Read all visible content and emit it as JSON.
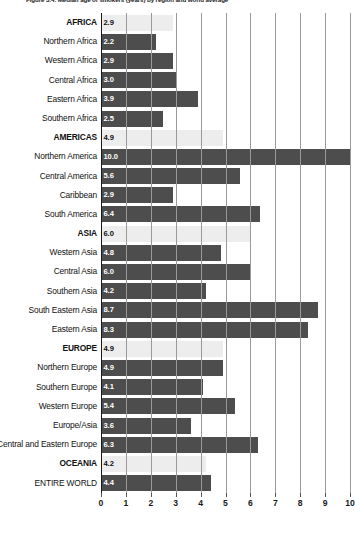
{
  "figure": {
    "title": "Figure 3.4: Median age of smokers (years) by region and world average"
  },
  "chart_data": {
    "type": "bar",
    "orientation": "horizontal",
    "title": "Figure 3.4: Median age of smokers (years) by region and world average",
    "xlabel": "",
    "ylabel": "",
    "xlim": [
      0,
      10
    ],
    "xticks": [
      "0",
      "1",
      "2",
      "3",
      "4",
      "5",
      "6",
      "7",
      "8",
      "9",
      "10"
    ],
    "grid": true,
    "legend": "none",
    "colors": {
      "region_header_bar": "#ededed",
      "subregion_bar": "#4d4d4d",
      "axis": "#1a1a1a",
      "gridline": "#9a9a9a",
      "header_value_text": "#111111",
      "bar_value_text": "#ffffff"
    },
    "categories": [
      "AFRICA",
      "Northern Africa",
      "Western Africa",
      "Central Africa",
      "Eastern Africa",
      "Southern Africa",
      "AMERICAS",
      "Northern America",
      "Central America",
      "Caribbean",
      "South America",
      "ASIA",
      "Western Asia",
      "Central Asia",
      "Southern Asia",
      "South Eastern Asia",
      "Eastern Asia",
      "EUROPE",
      "Northern Europe",
      "Southern Europe",
      "Western Europe",
      "Europe/Asia",
      "Central and Eastern Europe",
      "OCEANIA",
      "ENTIRE WORLD"
    ],
    "values": [
      2.9,
      2.2,
      2.9,
      3.0,
      3.9,
      2.5,
      4.9,
      10.0,
      5.6,
      2.9,
      6.4,
      6.0,
      4.8,
      6.0,
      4.2,
      8.7,
      8.3,
      4.9,
      4.9,
      4.1,
      5.4,
      3.6,
      6.3,
      4.2,
      4.4
    ]
  },
  "rows": [
    {
      "label": "AFRICA",
      "value": "2.9",
      "num": 2.9,
      "header": true
    },
    {
      "label": "Northern Africa",
      "value": "2.2",
      "num": 2.2,
      "header": false
    },
    {
      "label": "Western Africa",
      "value": "2.9",
      "num": 2.9,
      "header": false
    },
    {
      "label": "Central Africa",
      "value": "3.0",
      "num": 3.0,
      "header": false
    },
    {
      "label": "Eastern Africa",
      "value": "3.9",
      "num": 3.9,
      "header": false
    },
    {
      "label": "Southern Africa",
      "value": "2.5",
      "num": 2.5,
      "header": false
    },
    {
      "label": "AMERICAS",
      "value": "4.9",
      "num": 4.9,
      "header": true
    },
    {
      "label": "Northern America",
      "value": "10.0",
      "num": 10.0,
      "header": false
    },
    {
      "label": "Central America",
      "value": "5.6",
      "num": 5.6,
      "header": false
    },
    {
      "label": "Caribbean",
      "value": "2.9",
      "num": 2.9,
      "header": false
    },
    {
      "label": "South America",
      "value": "6.4",
      "num": 6.4,
      "header": false
    },
    {
      "label": "ASIA",
      "value": "6.0",
      "num": 6.0,
      "header": true
    },
    {
      "label": "Western Asia",
      "value": "4.8",
      "num": 4.8,
      "header": false
    },
    {
      "label": "Central Asia",
      "value": "6.0",
      "num": 6.0,
      "header": false
    },
    {
      "label": "Southern Asia",
      "value": "4.2",
      "num": 4.2,
      "header": false
    },
    {
      "label": "South Eastern Asia",
      "value": "8.7",
      "num": 8.7,
      "header": false
    },
    {
      "label": "Eastern Asia",
      "value": "8.3",
      "num": 8.3,
      "header": false
    },
    {
      "label": "EUROPE",
      "value": "4.9",
      "num": 4.9,
      "header": true
    },
    {
      "label": "Northern Europe",
      "value": "4.9",
      "num": 4.9,
      "header": false
    },
    {
      "label": "Southern Europe",
      "value": "4.1",
      "num": 4.1,
      "header": false
    },
    {
      "label": "Western Europe",
      "value": "5.4",
      "num": 5.4,
      "header": false
    },
    {
      "label": "Europe/Asia",
      "value": "3.6",
      "num": 3.6,
      "header": false
    },
    {
      "label": "Central and Eastern Europe",
      "value": "6.3",
      "num": 6.3,
      "header": false
    },
    {
      "label": "OCEANIA",
      "value": "4.2",
      "num": 4.2,
      "header": true
    },
    {
      "label": "ENTIRE WORLD",
      "value": "4.4",
      "num": 4.4,
      "header": false
    }
  ],
  "axis": {
    "ticks": [
      "0",
      "1",
      "2",
      "3",
      "4",
      "5",
      "6",
      "7",
      "8",
      "9",
      "10"
    ]
  }
}
